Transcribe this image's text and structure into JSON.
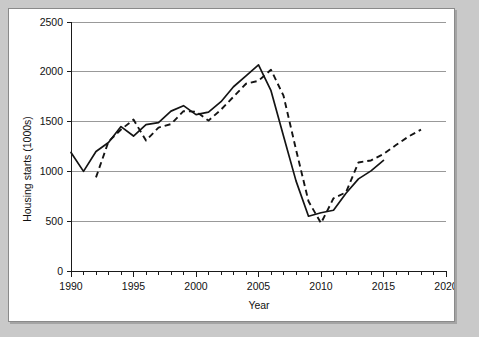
{
  "chart_data": {
    "type": "line",
    "title": "",
    "xlabel": "Year",
    "ylabel": "Housing starts (1000s)",
    "xlim": [
      1990,
      2020
    ],
    "ylim": [
      0,
      2500
    ],
    "grid": true,
    "legend": "none",
    "x_ticks": [
      1990,
      1995,
      2000,
      2005,
      2010,
      2015,
      2020
    ],
    "x_tick_labels": [
      "1990",
      "1995",
      "2000",
      "2005",
      "2010",
      "2015",
      "2020"
    ],
    "x_minor_tick_interval": 1,
    "y_ticks": [
      0,
      500,
      1000,
      1500,
      2000,
      2500
    ],
    "y_tick_labels": [
      "0",
      "500",
      "1000",
      "1500",
      "2000",
      "2500"
    ],
    "series": [
      {
        "name": "solid-series",
        "style": "solid",
        "color": "#141414",
        "x": [
          1990,
          1991,
          1992,
          1993,
          1994,
          1995,
          1996,
          1997,
          1998,
          1999,
          2000,
          2001,
          2002,
          2003,
          2004,
          2005,
          2006,
          2007,
          2008,
          2009,
          2010,
          2011,
          2012,
          2013,
          2014,
          2015
        ],
        "values": [
          1190,
          1000,
          1200,
          1290,
          1450,
          1355,
          1470,
          1490,
          1605,
          1660,
          1570,
          1595,
          1700,
          1850,
          1960,
          2070,
          1810,
          1355,
          905,
          550,
          585,
          610,
          780,
          925,
          1005,
          1110
        ]
      },
      {
        "name": "dashed-series",
        "style": "dashed",
        "color": "#141414",
        "x": [
          1992,
          1993,
          1994,
          1995,
          1996,
          1997,
          1998,
          1999,
          2000,
          2001,
          2002,
          2003,
          2004,
          2005,
          2006,
          2007,
          2008,
          2009,
          2010,
          2011,
          2012,
          2013,
          2014,
          2015,
          2016,
          2017,
          2018
        ],
        "values": [
          940,
          1300,
          1420,
          1520,
          1310,
          1440,
          1475,
          1605,
          1600,
          1510,
          1620,
          1750,
          1880,
          1910,
          2020,
          1760,
          1220,
          700,
          480,
          730,
          790,
          1090,
          1110,
          1175,
          1265,
          1350,
          1420
        ]
      }
    ]
  },
  "axes": {
    "y_axis_title": "Housing starts (1000s)",
    "x_axis_title": "Year"
  }
}
